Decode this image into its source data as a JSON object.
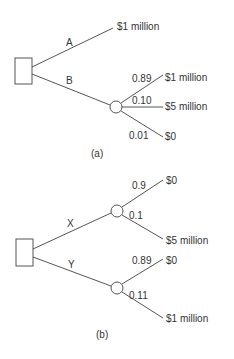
{
  "diagram_a": {
    "caption": "(a)",
    "decision_node": "decision",
    "branches": [
      {
        "label": "A",
        "outcome": "$1 million"
      },
      {
        "label": "B",
        "chance_outcomes": [
          {
            "prob": "0.89",
            "outcome": "$1 million"
          },
          {
            "prob": "0.10",
            "outcome": "$5 million"
          },
          {
            "prob": "0.01",
            "outcome": "$0"
          }
        ]
      }
    ]
  },
  "diagram_b": {
    "caption": "(b)",
    "decision_node": "decision",
    "branches": [
      {
        "label": "X",
        "chance_outcomes": [
          {
            "prob": "0.9",
            "outcome": "$0"
          },
          {
            "prob": "0.1",
            "outcome": "$5 million"
          }
        ]
      },
      {
        "label": "Y",
        "chance_outcomes": [
          {
            "prob": "0.89",
            "outcome": "$0"
          },
          {
            "prob": "0.11",
            "outcome": "$1 million"
          }
        ]
      }
    ]
  }
}
